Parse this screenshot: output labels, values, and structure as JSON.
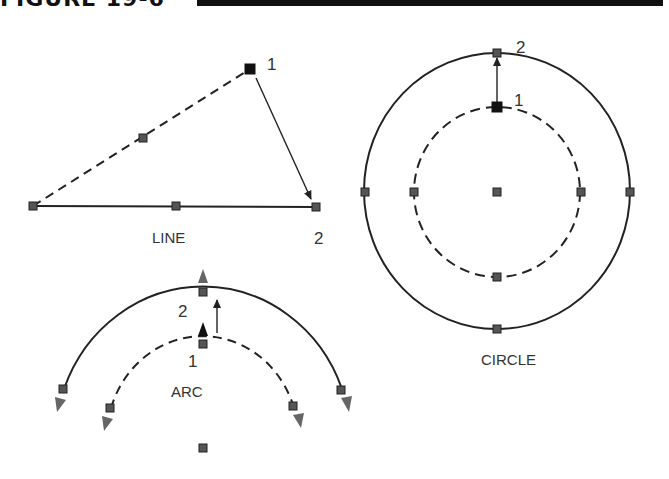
{
  "figure": {
    "title": "FIGURE 19-6"
  },
  "line_panel": {
    "label": "LINE",
    "point_labels": {
      "start": "1",
      "end": "2"
    }
  },
  "circle_panel": {
    "label": "CIRCLE",
    "point_labels": {
      "start": "1",
      "end": "2"
    }
  },
  "arc_panel": {
    "label": "ARC",
    "point_labels": {
      "start": "1",
      "end": "2"
    }
  },
  "colors": {
    "stroke": "#222222",
    "grip_fill": "#555555",
    "grip_selected": "#111111",
    "arrow_gray": "#666666",
    "label": "#333333"
  }
}
